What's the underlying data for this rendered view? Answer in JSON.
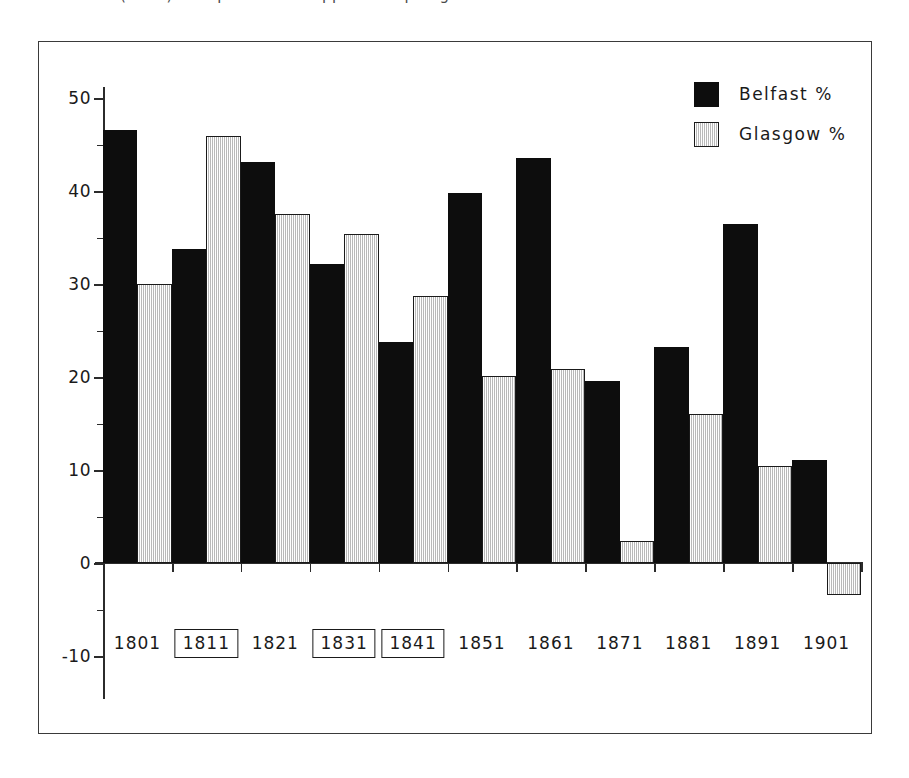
{
  "caption": {
    "cropped_text": "(cont.) — caption row cropped at top edge of screenshot"
  },
  "legend": {
    "position": "top-right",
    "entries": [
      {
        "label": "Belfast %",
        "swatch": "solid-black"
      },
      {
        "label": "Glasgow %",
        "swatch": "light-grey-hatched"
      }
    ]
  },
  "axes": {
    "y_ticks": [
      "50",
      "40",
      "30",
      "20",
      "10",
      "0",
      "-10"
    ],
    "y_minor_ticks": [
      "45",
      "35",
      "25",
      "15",
      "5",
      "-5"
    ],
    "x_ticks": [
      "1801",
      "1811",
      "1821",
      "1831",
      "1841",
      "1851",
      "1861",
      "1871",
      "1881",
      "1891",
      "1901"
    ],
    "x_boxed_ticks": [
      "1811",
      "1831",
      "1841"
    ]
  },
  "colors": {
    "belfast": "#0d0d0d",
    "glasgow_fill": "#e2e2e2",
    "glasgow_border": "#1a1a1a",
    "axis": "#2b2b2b",
    "frame": "#3a3a3a",
    "background": "#ffffff"
  },
  "chart_data": {
    "type": "bar",
    "title": "",
    "subtitle": "",
    "xlabel": "",
    "ylabel": "",
    "ylim": [
      -10,
      50
    ],
    "yticks": [
      -10,
      0,
      10,
      20,
      30,
      40,
      50
    ],
    "grid": false,
    "legend_position": "top-right",
    "categories": [
      "1801",
      "1811",
      "1821",
      "1831",
      "1841",
      "1851",
      "1861",
      "1871",
      "1881",
      "1891",
      "1901"
    ],
    "boxed_categories": [
      "1811",
      "1831",
      "1841"
    ],
    "series": [
      {
        "name": "Belfast %",
        "color": "#0d0d0d",
        "values": [
          46.6,
          33.8,
          43.1,
          32.2,
          23.8,
          39.8,
          43.6,
          19.6,
          23.2,
          36.4,
          11.1
        ]
      },
      {
        "name": "Glasgow %",
        "color": "#e2e2e2",
        "values": [
          30.0,
          45.9,
          37.5,
          35.4,
          28.7,
          20.1,
          20.9,
          2.4,
          16.0,
          10.4,
          -3.4
        ]
      }
    ]
  }
}
